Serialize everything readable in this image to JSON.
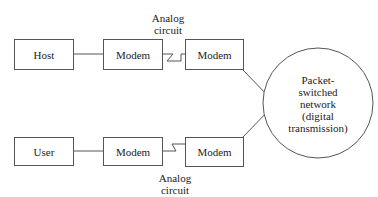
{
  "diagram": {
    "top_row": {
      "host": "Host",
      "modem_a": "Modem",
      "modem_b": "Modem",
      "circuit_label_line1": "Analog",
      "circuit_label_line2": "circuit"
    },
    "bottom_row": {
      "user": "User",
      "modem_a": "Modem",
      "modem_b": "Modem",
      "circuit_label_line1": "Analog",
      "circuit_label_line2": "circuit"
    },
    "network": {
      "line1": "Packet-",
      "line2": "switched",
      "line3": "network",
      "line4": "(digital",
      "line5": "transmission)"
    }
  }
}
